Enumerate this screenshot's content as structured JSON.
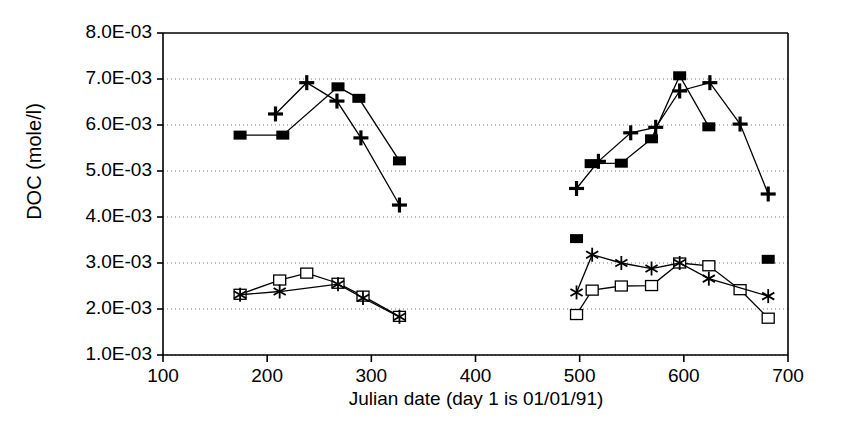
{
  "chart_data": {
    "type": "scatter",
    "title": "",
    "xlabel": "Julian date (day 1 is 01/01/91)",
    "ylabel": "DOC (mole/l)",
    "xlim": [
      100,
      700
    ],
    "ylim": [
      0.001,
      0.008
    ],
    "xticks": [
      100,
      200,
      300,
      400,
      500,
      600,
      700
    ],
    "yticks": [
      0.001,
      0.002,
      0.003,
      0.004,
      0.005,
      0.006,
      0.007,
      0.008
    ],
    "ytick_labels": [
      "1.0E-03",
      "2.0E-03",
      "3.0E-03",
      "4.0E-03",
      "5.0E-03",
      "6.0E-03",
      "7.0E-03",
      "8.0E-03"
    ],
    "xtick_labels": [
      "100",
      "200",
      "300",
      "400",
      "500",
      "600",
      "700"
    ],
    "grid": "horizontal-dotted",
    "legend": "none",
    "marker_color": "#000000",
    "line_color": "#000000",
    "background": "#ffffff",
    "series": [
      {
        "name": "upper-filled-square",
        "marker": "filled-square",
        "connected": true,
        "points": [
          {
            "x": 174,
            "y": 0.00578
          },
          {
            "x": 215,
            "y": 0.00578
          },
          {
            "x": 268,
            "y": 0.00683
          },
          {
            "x": 288,
            "y": 0.00658
          },
          {
            "x": 327,
            "y": 0.00522
          }
        ]
      },
      {
        "name": "upper-filled-square-2",
        "marker": "filled-square",
        "connected": true,
        "points": [
          {
            "x": 511,
            "y": 0.00516
          },
          {
            "x": 540,
            "y": 0.00517
          },
          {
            "x": 569,
            "y": 0.0057
          },
          {
            "x": 596,
            "y": 0.00707
          },
          {
            "x": 624,
            "y": 0.00596
          }
        ]
      },
      {
        "name": "upper-plus",
        "marker": "plus",
        "connected": true,
        "points": [
          {
            "x": 208,
            "y": 0.00624
          },
          {
            "x": 238,
            "y": 0.00692
          },
          {
            "x": 267,
            "y": 0.00652
          },
          {
            "x": 290,
            "y": 0.00572
          },
          {
            "x": 327,
            "y": 0.00426
          }
        ]
      },
      {
        "name": "upper-plus-2",
        "marker": "plus",
        "connected": true,
        "points": [
          {
            "x": 497,
            "y": 0.00462
          },
          {
            "x": 518,
            "y": 0.00521
          },
          {
            "x": 549,
            "y": 0.00583
          },
          {
            "x": 573,
            "y": 0.00595
          },
          {
            "x": 596,
            "y": 0.00674
          },
          {
            "x": 625,
            "y": 0.00692
          },
          {
            "x": 654,
            "y": 0.00602
          },
          {
            "x": 681,
            "y": 0.0045
          }
        ]
      },
      {
        "name": "lower-open-square",
        "marker": "open-square",
        "connected": true,
        "points": [
          {
            "x": 174,
            "y": 0.00232
          },
          {
            "x": 212,
            "y": 0.00263
          },
          {
            "x": 238,
            "y": 0.00278
          },
          {
            "x": 268,
            "y": 0.00256
          },
          {
            "x": 292,
            "y": 0.00228
          },
          {
            "x": 327,
            "y": 0.00184
          }
        ]
      },
      {
        "name": "lower-open-square-2",
        "marker": "open-square",
        "connected": true,
        "points": [
          {
            "x": 497,
            "y": 0.00188
          },
          {
            "x": 512,
            "y": 0.00241
          },
          {
            "x": 540,
            "y": 0.0025
          },
          {
            "x": 569,
            "y": 0.00251
          },
          {
            "x": 596,
            "y": 0.003
          },
          {
            "x": 624,
            "y": 0.00294
          },
          {
            "x": 654,
            "y": 0.00242
          },
          {
            "x": 681,
            "y": 0.0018
          }
        ]
      },
      {
        "name": "lower-asterisk",
        "marker": "asterisk",
        "connected": true,
        "points": [
          {
            "x": 174,
            "y": 0.00231
          },
          {
            "x": 212,
            "y": 0.00238
          },
          {
            "x": 268,
            "y": 0.00254
          },
          {
            "x": 292,
            "y": 0.00224
          },
          {
            "x": 327,
            "y": 0.00183
          }
        ]
      },
      {
        "name": "lower-asterisk-2",
        "marker": "asterisk",
        "connected": true,
        "points": [
          {
            "x": 497,
            "y": 0.00236
          },
          {
            "x": 512,
            "y": 0.00318
          },
          {
            "x": 540,
            "y": 0.003
          },
          {
            "x": 569,
            "y": 0.00288
          },
          {
            "x": 596,
            "y": 0.003
          },
          {
            "x": 624,
            "y": 0.00266
          },
          {
            "x": 681,
            "y": 0.00228
          }
        ]
      },
      {
        "name": "isolated-filled-square",
        "marker": "filled-square",
        "connected": false,
        "points": [
          {
            "x": 497,
            "y": 0.00353
          },
          {
            "x": 681,
            "y": 0.00308
          }
        ]
      }
    ]
  }
}
